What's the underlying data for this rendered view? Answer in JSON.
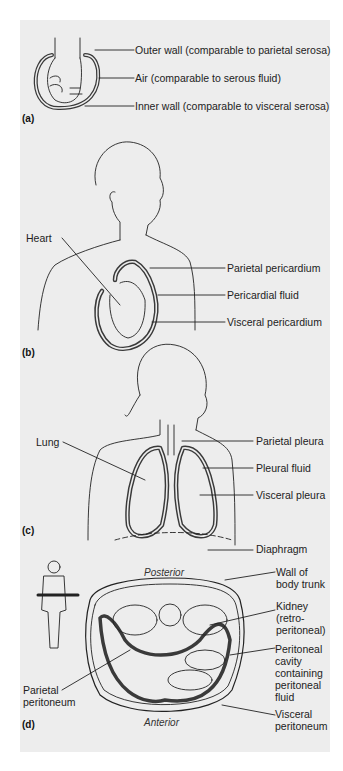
{
  "figure": {
    "panels": [
      {
        "tag": "(a)",
        "name": "fist-in-balloon",
        "labels": [
          "Outer wall (comparable to parietal serosa)",
          "Air (comparable to serous fluid)",
          "Inner wall (comparable to visceral serosa)"
        ]
      },
      {
        "tag": "(b)",
        "name": "pericardium",
        "left_labels": [
          "Heart"
        ],
        "labels": [
          "Parietal  pericardium",
          "Pericardial  fluid",
          "Visceral  pericardium"
        ]
      },
      {
        "tag": "(c)",
        "name": "pleura",
        "left_labels": [
          "Lung"
        ],
        "labels": [
          "Parietal  pleura",
          "Pleural  fluid",
          "Visceral  pleura",
          "Diaphragm"
        ]
      },
      {
        "tag": "(d)",
        "name": "peritoneum",
        "orientation": {
          "top": "Posterior",
          "bottom": "Anterior"
        },
        "left_labels": [
          "Parietal peritoneum"
        ],
        "labels": [
          "Wall of body trunk",
          "Kidney (retro-peritoneal)",
          "Peritoneal cavity containing peritoneal fluid",
          "Visceral peritoneum"
        ]
      }
    ],
    "colors": {
      "panel_bg": "#ededed",
      "line": "#222222",
      "membrane": "#3a3a3a"
    }
  }
}
